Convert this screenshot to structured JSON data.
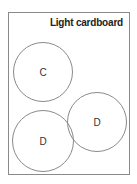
{
  "sheet": {
    "title": "Light cardboard",
    "circles": [
      {
        "label": "C",
        "cx": 43,
        "cy": 72,
        "r": 30
      },
      {
        "label": "D",
        "cx": 97,
        "cy": 122,
        "r": 30
      },
      {
        "label": "D",
        "cx": 43,
        "cy": 141,
        "r": 31
      }
    ]
  }
}
